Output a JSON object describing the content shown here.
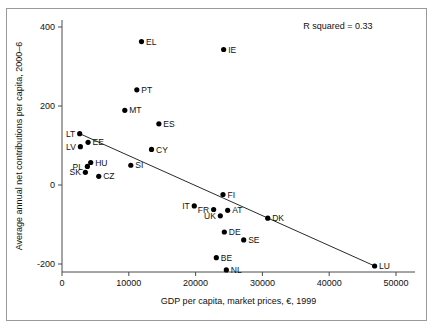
{
  "chart_data": {
    "type": "scatter",
    "title": "",
    "xlabel": "GDP per capita, market prices, €, 1999",
    "ylabel": "Average annual net contributions per capita, 2000–6",
    "xlim": [
      0,
      50000
    ],
    "ylim": [
      -260,
      420
    ],
    "xticks": [
      0,
      10000,
      20000,
      30000,
      40000,
      50000
    ],
    "xtick_labels": [
      "0",
      "10000",
      "20000",
      "30000",
      "40000",
      "50000"
    ],
    "yticks": [
      -200,
      0,
      200,
      400
    ],
    "ytick_labels": [
      "-200",
      "0",
      "200",
      "400"
    ],
    "grid": false,
    "legend": false,
    "annotations": [
      {
        "name": "r-squared",
        "text": "R squared = 0.33",
        "x": 46500,
        "y": 395
      }
    ],
    "trendline": {
      "type": "linear",
      "x0": 2650,
      "y0": 130,
      "x1": 46800,
      "y1": -205,
      "r_squared": 0.33
    },
    "points": [
      {
        "label": "EL",
        "x": 11900,
        "y": 363,
        "label_pos": "right"
      },
      {
        "label": "IE",
        "x": 24200,
        "y": 343,
        "label_pos": "right"
      },
      {
        "label": "PT",
        "x": 11200,
        "y": 241,
        "label_pos": "right"
      },
      {
        "label": "MT",
        "x": 9400,
        "y": 189,
        "label_pos": "right"
      },
      {
        "label": "ES",
        "x": 14500,
        "y": 155,
        "label_pos": "right"
      },
      {
        "label": "LT",
        "x": 2650,
        "y": 130,
        "label_pos": "left"
      },
      {
        "label": "EE",
        "x": 3900,
        "y": 108,
        "label_pos": "right"
      },
      {
        "label": "LV",
        "x": 2750,
        "y": 97,
        "label_pos": "left"
      },
      {
        "label": "CY",
        "x": 13400,
        "y": 90,
        "label_pos": "right"
      },
      {
        "label": "HU",
        "x": 4300,
        "y": 57,
        "label_pos": "right"
      },
      {
        "label": "PL",
        "x": 3800,
        "y": 47,
        "label_pos": "left"
      },
      {
        "label": "SI",
        "x": 10300,
        "y": 50,
        "label_pos": "right"
      },
      {
        "label": "SK",
        "x": 3500,
        "y": 32,
        "label_pos": "left"
      },
      {
        "label": "CZ",
        "x": 5500,
        "y": 22,
        "label_pos": "right"
      },
      {
        "label": "FI",
        "x": 24100,
        "y": -24,
        "label_pos": "right"
      },
      {
        "label": "IT",
        "x": 19800,
        "y": -53,
        "label_pos": "left"
      },
      {
        "label": "FR",
        "x": 22700,
        "y": -62,
        "label_pos": "left"
      },
      {
        "label": "AT",
        "x": 24800,
        "y": -64,
        "label_pos": "right"
      },
      {
        "label": "UK",
        "x": 23700,
        "y": -78,
        "label_pos": "left"
      },
      {
        "label": "DK",
        "x": 30800,
        "y": -84,
        "label_pos": "right"
      },
      {
        "label": "DE",
        "x": 24300,
        "y": -119,
        "label_pos": "right"
      },
      {
        "label": "SE",
        "x": 27200,
        "y": -139,
        "label_pos": "right"
      },
      {
        "label": "BE",
        "x": 23100,
        "y": -184,
        "label_pos": "right"
      },
      {
        "label": "NL",
        "x": 24600,
        "y": -215,
        "label_pos": "right"
      },
      {
        "label": "LU",
        "x": 46800,
        "y": -205,
        "label_pos": "right"
      }
    ]
  },
  "colors": {
    "marker": "#000000",
    "axis": "#4a4a4a",
    "trend": "#2a2a2a",
    "frame": "#9a9a9a",
    "background": "#ffffff"
  }
}
